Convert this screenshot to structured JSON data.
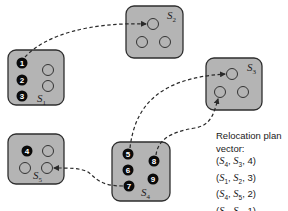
{
  "diagram": {
    "type": "vm-relocation",
    "colors": {
      "server_fill": "#b4b4b4",
      "server_border": "#2e2e2e",
      "vm_fill": "#0a0a0a",
      "vm_text": "#ffffff",
      "arrow": "#2a2a2a"
    },
    "servers": [
      {
        "id": "S1",
        "label": "S",
        "sub": "1",
        "vms": [
          "1",
          "2",
          "3"
        ],
        "empty_slots": 2
      },
      {
        "id": "S2",
        "label": "S",
        "sub": "2",
        "vms": [],
        "empty_slots": 3
      },
      {
        "id": "S3",
        "label": "S",
        "sub": "3",
        "vms": [],
        "empty_slots": 3
      },
      {
        "id": "S4",
        "label": "S",
        "sub": "4",
        "vms": [
          "5",
          "6",
          "7",
          "8",
          "9"
        ],
        "empty_slots": 0
      },
      {
        "id": "S5",
        "label": "S",
        "sub": "5",
        "vms": [
          "4"
        ],
        "empty_slots": 3
      }
    ],
    "moves": [
      {
        "from_vm": "1",
        "from": "S1",
        "to": "S2"
      },
      {
        "from_vm": "5",
        "from": "S4",
        "to": "S3"
      },
      {
        "from_vm": "8",
        "from": "S4",
        "to": "S3"
      },
      {
        "from_vm": "7",
        "from": "S4",
        "to": "S5"
      }
    ]
  },
  "plan": {
    "title_line1": "Relocation plan",
    "title_line2": "vector:",
    "entries": [
      {
        "src": "4",
        "dst": "3",
        "count": "4"
      },
      {
        "src": "1",
        "dst": "2",
        "count": "3"
      },
      {
        "src": "4",
        "dst": "5",
        "count": "2"
      },
      {
        "src": "4",
        "dst": "3",
        "count": "1"
      }
    ]
  }
}
